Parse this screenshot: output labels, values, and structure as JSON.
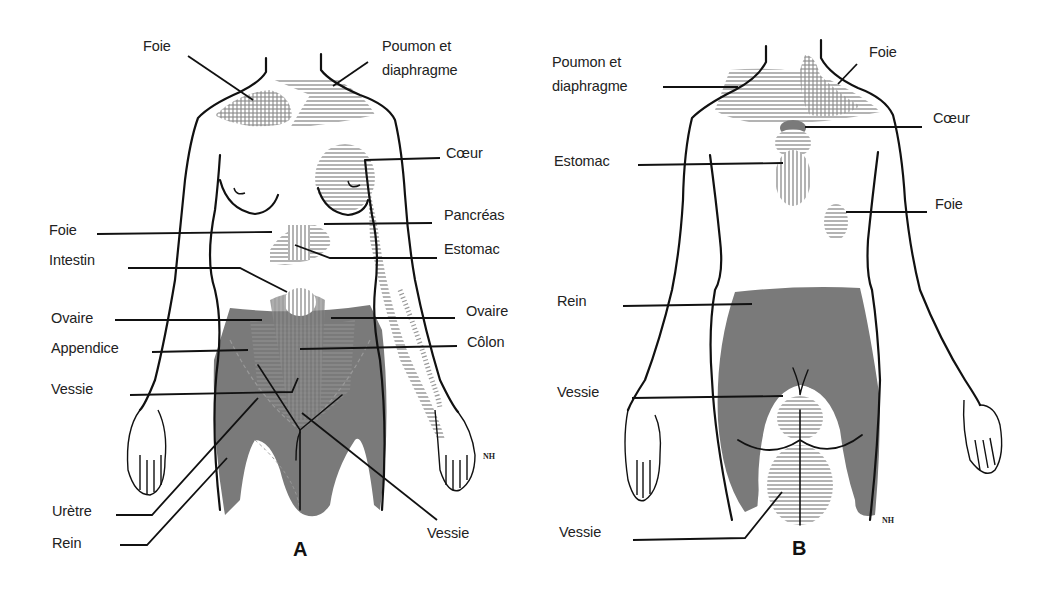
{
  "figure_a": {
    "caption": "A",
    "view": "anterior",
    "labels": {
      "foie_top": "Foie",
      "poumon_line1": "Poumon et",
      "poumon_line2": "diaphragme",
      "coeur": "Cœur",
      "pancreas": "Pancréas",
      "estomac": "Estomac",
      "foie_mid": "Foie",
      "intestin": "Intestin",
      "ovaire_left": "Ovaire",
      "ovaire_right": "Ovaire",
      "appendice": "Appendice",
      "colon": "Côlon",
      "vessie_left": "Vessie",
      "vessie_right": "Vessie",
      "uretre": "Urètre",
      "rein": "Rein"
    },
    "signature": "NH"
  },
  "figure_b": {
    "caption": "B",
    "view": "posterior",
    "labels": {
      "poumon_line1": "Poumon et",
      "poumon_line2": "diaphragme",
      "foie_top": "Foie",
      "coeur": "Cœur",
      "estomac": "Estomac",
      "foie_mid": "Foie",
      "rein": "Rein",
      "vessie_upper": "Vessie",
      "vessie_lower": "Vessie"
    },
    "signature": "NH"
  },
  "colors": {
    "outline": "#111111",
    "shading_solid": "#7a7a7a",
    "hatching": "#8a8a8a",
    "text": "#222222"
  }
}
